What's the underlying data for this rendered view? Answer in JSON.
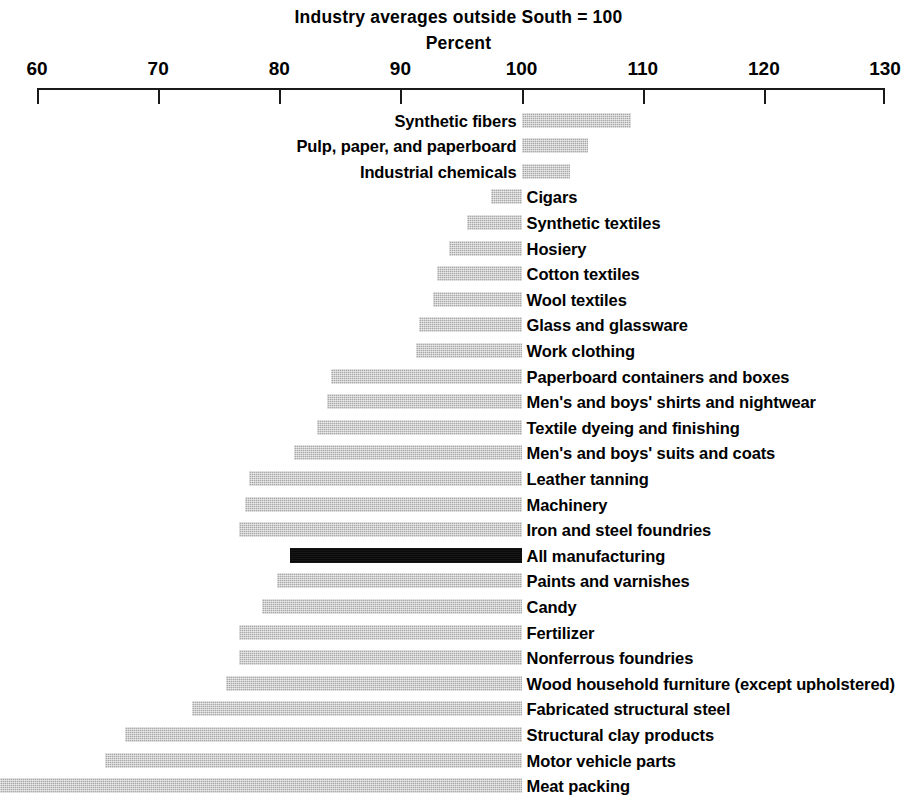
{
  "chart_data": {
    "type": "bar",
    "orientation": "horizontal",
    "title": "Industry averages outside South = 100",
    "subtitle": "Percent",
    "xlabel": "Percent",
    "ylabel": "",
    "xlim": [
      60,
      130
    ],
    "baseline": 100,
    "grid": false,
    "legend": null,
    "xticks": [
      60,
      70,
      80,
      90,
      100,
      110,
      120,
      130
    ],
    "xtick_labels": [
      "60",
      "70",
      "80",
      "90",
      "100",
      "110",
      "120",
      "130"
    ],
    "categories": [
      "Synthetic fibers",
      "Pulp, paper, and paperboard",
      "Industrial chemicals",
      "Cigars",
      "Synthetic textiles",
      "Hosiery",
      "Cotton textiles",
      "Wool textiles",
      "Glass and glassware",
      "Work clothing",
      "Paperboard containers and boxes",
      "Men's and boys' shirts and nightwear",
      "Textile dyeing and finishing",
      "Men's and boys' suits and coats",
      "Leather tanning",
      "Machinery",
      "Iron and steel foundries",
      "All manufacturing",
      "Paints and varnishes",
      "Candy",
      "Fertilizer",
      "Nonferrous foundries",
      "Wood household furniture (except upholstered)",
      "Fabricated structural steel",
      "Structural clay products",
      "Motor vehicle parts",
      "Meat packing"
    ],
    "values": [
      109.0,
      105.5,
      104.0,
      97.5,
      95.5,
      94.0,
      93.0,
      92.7,
      91.5,
      91.3,
      84.3,
      83.9,
      83.1,
      81.2,
      77.5,
      77.2,
      76.7,
      80.9,
      79.8,
      78.6,
      76.7,
      76.7,
      75.6,
      72.8,
      67.3,
      65.6,
      55.3
    ],
    "highlight_category": "All manufacturing",
    "colors": {
      "bar": "#a8a8a8",
      "highlight_bar": "#0a0a0a",
      "axis": "#1a1a1a",
      "text": "#000000",
      "background": "#ffffff"
    }
  }
}
